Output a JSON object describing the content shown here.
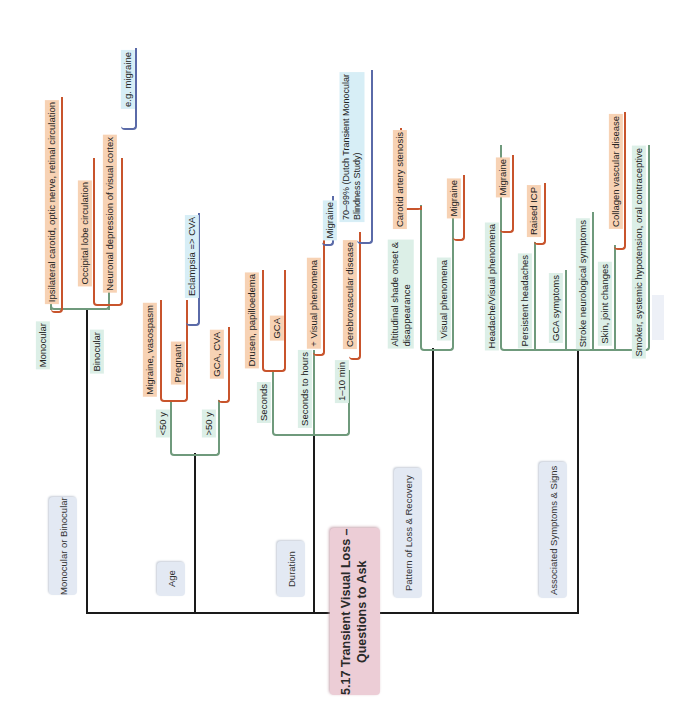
{
  "title": {
    "line1": "5.17 Transient Visual Loss –",
    "line2": "Questions to Ask"
  },
  "colors": {
    "spine": "#1a1a1a",
    "green_branch": "#6f9a7c",
    "orange_branch": "#c8542c",
    "blue_branch": "#5a6aa8",
    "category_box": "#e3e9f3",
    "title_box": "#eccdd6",
    "green_label_bg": "#dcefe7",
    "orange_label_bg": "#f7d2b4",
    "blue_label_bg": "#d7eef6"
  },
  "categories": {
    "monocular_binocular": {
      "label": "Monocular or Binocular",
      "children": {
        "monocular": {
          "label": "Monocular",
          "cause": "Ipsilateral carotid, optic nerve, retinal circulation"
        },
        "binocular": {
          "label": "Binocular",
          "cause1": "Occipital lobe circulation",
          "cause2": "Neuronal depression of visual cortex",
          "cause2_example": "e.g. migraine"
        }
      }
    },
    "age": {
      "label": "Age",
      "children": {
        "under50": {
          "label": "<50 y",
          "cause1": "Migraine, vasospasm",
          "pregnant": "Pregnant",
          "pregnant_note": "Eclampsia => CVA"
        },
        "over50": {
          "label": ">50 y",
          "cause": "GCA, CVA"
        }
      }
    },
    "duration": {
      "label": "Duration",
      "children": {
        "seconds": {
          "label": "Seconds",
          "cause1": "Drusen, papilloedema",
          "cause2": "GCA"
        },
        "seconds_to_hours": {
          "label": "Seconds to hours",
          "cause": "+ Visual phenomena",
          "note": "Migraine"
        },
        "one_to_ten_min": {
          "label": "1–10 min",
          "cause": "Cerebrovascular disease",
          "note_line1": "70–99% (Dutch Transient Monocular",
          "note_line2": "Blindness Study)"
        }
      }
    },
    "pattern": {
      "label": "Pattern of Loss & Recovery",
      "children": {
        "altitudinal": {
          "line1": "Altitudinal shade onset &",
          "line2": "disappearance",
          "cause": "Carotid artery stenosis"
        },
        "visual": {
          "label": "Visual phenomena",
          "cause": "Migraine"
        }
      }
    },
    "associated": {
      "label": "Associated Symptoms & Signs",
      "children": {
        "headache_visual": {
          "label": "Headache/Visual phenomena",
          "cause": "Migraine"
        },
        "persistent": {
          "label": "Persistent headaches",
          "cause": "Raised ICP"
        },
        "gca": {
          "label": "GCA symptoms"
        },
        "stroke": {
          "label": "Stroke neurological symptoms"
        },
        "skin": {
          "label": "Skin, joint changes",
          "cause": "Collagen vascular disease"
        },
        "smoker": {
          "label": "Smoker, systemic hypotension, oral contraceptive"
        }
      }
    }
  }
}
